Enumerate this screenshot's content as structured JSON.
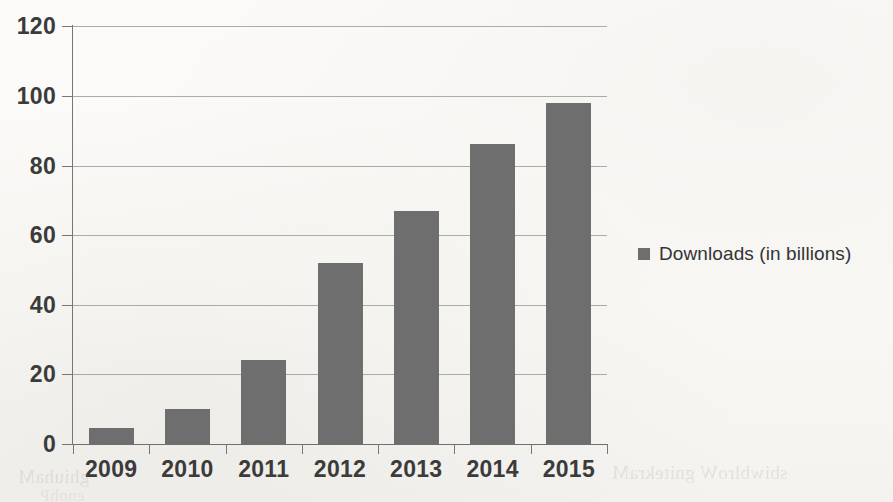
{
  "chart_data": {
    "type": "bar",
    "title": "",
    "subtitle": "",
    "xlabel": "",
    "ylabel": "",
    "categories": [
      "2009",
      "2010",
      "2011",
      "2012",
      "2013",
      "2014",
      "2015"
    ],
    "values": [
      4.5,
      10,
      24,
      52,
      67,
      86,
      98
    ],
    "series": [
      {
        "name": "Downloads (in billions)",
        "values": [
          4.5,
          10,
          24,
          52,
          67,
          86,
          98
        ]
      }
    ],
    "ylim": [
      0,
      120
    ],
    "ytick_labels": [
      "0",
      "20",
      "40",
      "60",
      "80",
      "100",
      "120"
    ],
    "ytick_values": [
      0,
      20,
      40,
      60,
      80,
      100,
      120
    ],
    "grid": "horizontal",
    "legend_position": "right",
    "bar_color": "#6e6e6e",
    "gridline_color": "#9d9d99",
    "axis_color": "#767673",
    "text_color": "#3b3b3b",
    "background_color": "#fbfaf8"
  },
  "legend": {
    "entries": [
      {
        "label": "Downloads (in billions)",
        "color": "#6e6e6e",
        "swatch_icon": "square-swatch-icon"
      }
    ]
  },
  "page": {
    "ghost_text_1": "ghiuhaM",
    "ghost_text_2": "sbiwblroW gnitekraM",
    "ghost_text_3": "enohP"
  }
}
